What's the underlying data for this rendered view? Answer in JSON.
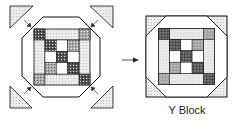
{
  "diagram": {
    "caption": "Y Block",
    "colors": {
      "line": "#111111",
      "light_fill": "#e6e6e6",
      "medium_fill": "#9a9a9a",
      "dark_fill": "#4a4a4a",
      "white": "#ffffff"
    },
    "steps": [
      {
        "name": "unassembled",
        "description": "Nine-patch center framed in octagon with four corner triangles pointing inward"
      },
      {
        "name": "assembled",
        "description": "Corner triangles sewn on to form square Y Block"
      }
    ]
  }
}
